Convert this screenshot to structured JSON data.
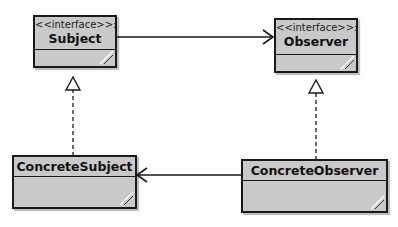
{
  "diagram": {
    "type": "UML class diagram",
    "pattern": "Observer",
    "classes": [
      {
        "id": "subject",
        "stereotype": "<<interface>>:",
        "name": "Subject"
      },
      {
        "id": "observer",
        "stereotype": "<<interface>>:",
        "name": "Observer"
      },
      {
        "id": "concrete_subject",
        "stereotype": "",
        "name": "ConcreteSubject"
      },
      {
        "id": "concrete_observer",
        "stereotype": "",
        "name": "ConcreteObserver"
      }
    ],
    "relations": [
      {
        "from": "subject",
        "to": "observer",
        "kind": "association",
        "arrow": "open"
      },
      {
        "from": "concrete_observer",
        "to": "concrete_subject",
        "kind": "association",
        "arrow": "open"
      },
      {
        "from": "concrete_subject",
        "to": "subject",
        "kind": "realization",
        "arrow": "hollow-triangle",
        "line": "dashed"
      },
      {
        "from": "concrete_observer",
        "to": "observer",
        "kind": "realization",
        "arrow": "hollow-triangle",
        "line": "dashed"
      }
    ],
    "colors": {
      "fill": "#c9c9c9",
      "stroke": "#1a1a1a",
      "background": "#ffffff"
    }
  }
}
